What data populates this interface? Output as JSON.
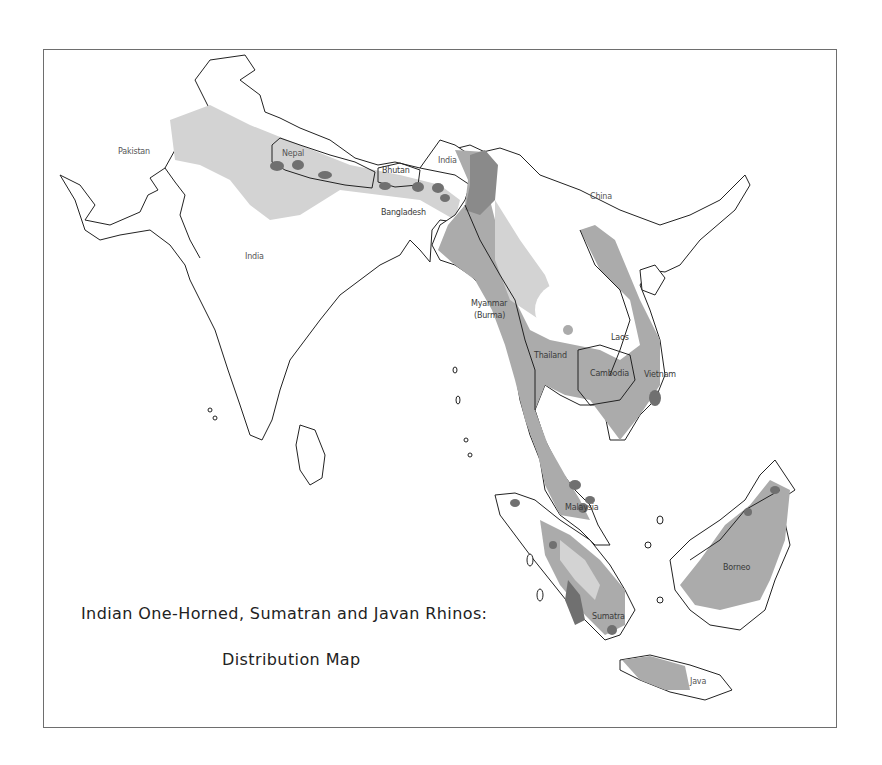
{
  "title": {
    "line1": "Indian One-Horned, Sumatran and Javan Rhinos:",
    "line2": "Distribution Map"
  },
  "labels": {
    "pakistan": "Pakistan",
    "nepal": "Nepal",
    "india_main": "India",
    "india_ne": "India",
    "bhutan": "Bhutan",
    "bangladesh": "Bangladesh",
    "china": "China",
    "myanmar_1": "Myanmar",
    "myanmar_2": "(Burma)",
    "thailand": "Thailand",
    "laos": "Laos",
    "cambodia": "Cambodia",
    "vietnam": "Vietnam",
    "malaysia": "Malaysia",
    "sumatra": "Sumatra",
    "borneo": "Borneo",
    "java": "Java"
  },
  "colors": {
    "indian_rhino_range": "#d3d3d3",
    "sumatran_rhino_range": "#ababab",
    "current_population": "#707070",
    "border": "#222222",
    "frame": "#6e6e6e"
  }
}
